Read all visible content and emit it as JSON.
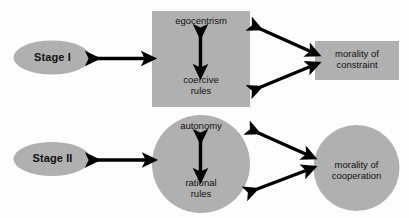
{
  "diagram": {
    "background_color": "#fdfdfd",
    "shape_fill_color": "#b0b0b0",
    "arrow_color": "#000000",
    "text_color": "#111111",
    "rows": [
      {
        "id": "stage-1",
        "stage_label": "Stage I",
        "center_top_label": "egocentrism",
        "center_bottom_label": "coercive\nrules",
        "outcome_label": "morality of\nconstraint",
        "center_shape": "square",
        "outcome_shape": "rectangle"
      },
      {
        "id": "stage-2",
        "stage_label": "Stage II",
        "center_top_label": "autonomy",
        "center_bottom_label": "rational\nrules",
        "outcome_label": "morality of\ncooperation",
        "center_shape": "circle",
        "outcome_shape": "circle"
      }
    ],
    "connectors": [
      {
        "id": "stage1-to-center",
        "type": "double-headed-horizontal-arrow"
      },
      {
        "id": "stage1-center-internal",
        "type": "double-headed-vertical-arrow"
      },
      {
        "id": "stage1-center-to-outcome-upper",
        "type": "double-headed-diagonal-arrow"
      },
      {
        "id": "stage1-center-to-outcome-lower",
        "type": "double-headed-diagonal-arrow"
      },
      {
        "id": "stage2-to-center",
        "type": "double-headed-horizontal-arrow"
      },
      {
        "id": "stage2-center-internal",
        "type": "double-headed-vertical-arrow"
      },
      {
        "id": "stage2-center-to-outcome-upper",
        "type": "double-headed-diagonal-arrow"
      },
      {
        "id": "stage2-center-to-outcome-lower",
        "type": "double-headed-diagonal-arrow"
      }
    ]
  }
}
